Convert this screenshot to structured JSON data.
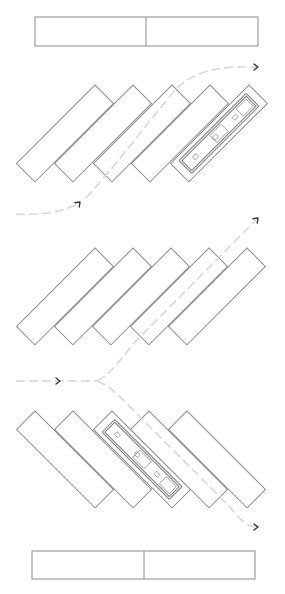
{
  "diagram": {
    "title": "",
    "colors": {
      "stall_stroke": "#8a8a8a",
      "path_stroke": "#d4d4d4",
      "arrowhead": "#333333",
      "background": "#ffffff"
    },
    "bars": [
      {
        "name": "top-bar",
        "x": 35,
        "y": 17,
        "w": 223,
        "h": 29,
        "divider_x": 146
      },
      {
        "name": "bottom-bar",
        "x": 32,
        "y": 551,
        "w": 223,
        "h": 28,
        "divider_x": 144
      }
    ],
    "rows": [
      {
        "name": "row-1",
        "orientation": "left-leaning",
        "top_y": 85,
        "top_xs": [
          95,
          133,
          172,
          210,
          249
        ],
        "vehicle_index": 4
      },
      {
        "name": "row-2",
        "orientation": "left-leaning",
        "top_y": 248,
        "top_xs": [
          95,
          133,
          171,
          209,
          247
        ],
        "vehicle_index": null
      },
      {
        "name": "row-3",
        "orientation": "right-leaning",
        "top_y": 411,
        "top_xs": [
          35,
          73,
          112,
          149,
          187
        ],
        "vehicle_index": 2
      }
    ],
    "paths": [
      {
        "name": "path-entry-row1",
        "d": "M16,214 C40,216 62,212 80,203",
        "arrow_at": [
          80,
          202
        ],
        "arrow_dir": "up-right"
      },
      {
        "name": "path-exit-row1",
        "d": "M86,198 C120,160 150,120 175,90 C195,70 220,66 256,67",
        "arrow_at": [
          258,
          67
        ],
        "arrow_dir": "right"
      },
      {
        "name": "path-entry-row2",
        "d": "M16,381 L97,381",
        "arrow_at": [
          60,
          381
        ],
        "arrow_dir": "right"
      },
      {
        "name": "path-exit-up",
        "d": "M97,381 C110,375 120,360 135,342 L256,220",
        "arrow_at": [
          258,
          218
        ],
        "arrow_dir": "up-right"
      },
      {
        "name": "path-exit-down",
        "d": "M97,381 C110,386 118,395 128,405 L228,505 C236,514 244,526 256,527",
        "arrow_at": [
          258,
          527
        ],
        "arrow_dir": "right"
      }
    ]
  }
}
